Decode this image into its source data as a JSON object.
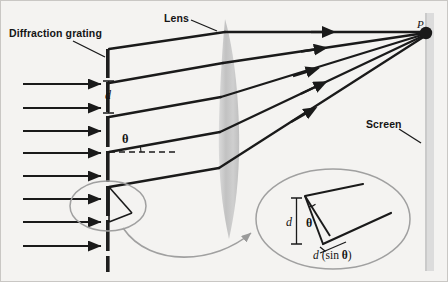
{
  "figure": {
    "title_description": "Diffraction grating with lens focusing diffracted rays to point P on a screen",
    "background_color": "#f4f3f1",
    "ink_color": "#1a1a1a",
    "accent_gray": "#9a9a9a",
    "lens_fill": "#c6c6c6",
    "screen_fill": "#d8d8d8"
  },
  "labels": {
    "grating": "Diffraction grating",
    "lens": "Lens",
    "screen": "Screen",
    "point_p": "P",
    "slit_spacing": "d",
    "angle": "θ",
    "inset_spacing": "d",
    "inset_angle": "θ",
    "path_difference_d": "d",
    "path_difference_sin": "(sin",
    "path_difference_theta": "θ",
    "path_difference_close": ")"
  },
  "elements": {
    "incoming_wavefront_arrows": 8,
    "diffracted_rays": 5,
    "grating_bars": 7,
    "inset_present": true,
    "callout_circle_present": true
  }
}
